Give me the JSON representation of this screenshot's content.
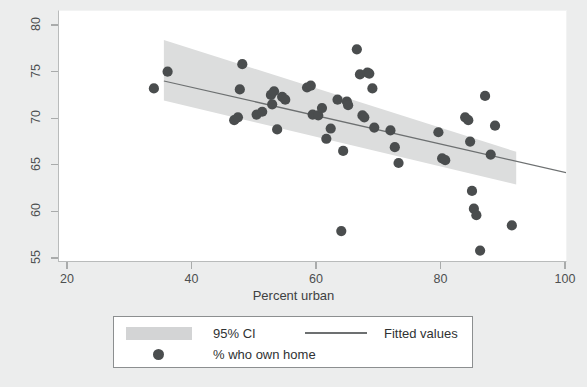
{
  "chart_data": {
    "type": "scatter",
    "title": "",
    "xlabel": "Percent urban",
    "ylabel": "",
    "xlim": [
      20,
      100
    ],
    "ylim": [
      53.5,
      81.5
    ],
    "xticks": [
      20,
      40,
      60,
      80,
      100
    ],
    "yticks": [
      55,
      60,
      65,
      70,
      75,
      80
    ],
    "grid": false,
    "legend_position": "below-axes",
    "series": [
      {
        "name": "% who own home",
        "type": "scatter",
        "marker": "circle",
        "color": "#4a4d4e",
        "points": [
          [
            33.8,
            73.3
          ],
          [
            36.0,
            75.1
          ],
          [
            46.7,
            69.9
          ],
          [
            47.3,
            70.2
          ],
          [
            47.6,
            73.2
          ],
          [
            48.0,
            75.9
          ],
          [
            50.3,
            70.5
          ],
          [
            51.2,
            70.8
          ],
          [
            52.6,
            72.6
          ],
          [
            52.8,
            71.6
          ],
          [
            53.1,
            73.0
          ],
          [
            53.6,
            68.9
          ],
          [
            54.4,
            72.4
          ],
          [
            54.9,
            72.1
          ],
          [
            58.4,
            73.4
          ],
          [
            59.0,
            73.6
          ],
          [
            59.3,
            70.5
          ],
          [
            60.2,
            70.4
          ],
          [
            60.8,
            71.2
          ],
          [
            61.5,
            67.9
          ],
          [
            62.2,
            69.0
          ],
          [
            63.3,
            72.1
          ],
          [
            63.9,
            58.0
          ],
          [
            64.2,
            66.6
          ],
          [
            64.8,
            71.9
          ],
          [
            65.0,
            71.5
          ],
          [
            66.4,
            77.5
          ],
          [
            66.9,
            74.8
          ],
          [
            67.3,
            70.4
          ],
          [
            67.6,
            70.2
          ],
          [
            68.1,
            75.0
          ],
          [
            68.4,
            74.9
          ],
          [
            68.9,
            73.3
          ],
          [
            69.2,
            69.1
          ],
          [
            71.8,
            68.8
          ],
          [
            72.5,
            67.0
          ],
          [
            73.1,
            65.3
          ],
          [
            79.5,
            68.6
          ],
          [
            80.1,
            65.8
          ],
          [
            80.6,
            65.6
          ],
          [
            83.8,
            70.2
          ],
          [
            84.3,
            69.9
          ],
          [
            84.6,
            67.6
          ],
          [
            84.9,
            62.3
          ],
          [
            85.2,
            60.4
          ],
          [
            85.6,
            59.7
          ],
          [
            86.2,
            55.9
          ],
          [
            87.0,
            72.5
          ],
          [
            87.9,
            66.2
          ],
          [
            88.6,
            69.3
          ],
          [
            91.3,
            58.6
          ]
        ]
      },
      {
        "name": "Fitted values",
        "type": "line",
        "color": "#6d7071",
        "endpoints": [
          [
            35.4,
            74.1
          ],
          [
            101.8,
            64.0
          ]
        ]
      },
      {
        "name": "95% CI",
        "type": "band",
        "color": "#dcdddd",
        "x_range": [
          35.4,
          92.0
        ],
        "upper": [
          [
            35.4,
            78.5
          ],
          [
            92.0,
            66.5
          ]
        ],
        "lower": [
          [
            35.4,
            72.0
          ],
          [
            92.0,
            63.0
          ]
        ]
      }
    ]
  },
  "axes": {
    "y_tick_labels": [
      "55",
      "60",
      "65",
      "70",
      "75",
      "80"
    ],
    "x_tick_labels": [
      "20",
      "40",
      "60",
      "80",
      "100"
    ],
    "x_title": "Percent urban"
  },
  "legend": {
    "items": [
      {
        "label": "95% CI",
        "swatch": "band-swatch"
      },
      {
        "label": "Fitted values",
        "swatch": "line-swatch"
      },
      {
        "label": "% who own home",
        "swatch": "dot-swatch"
      }
    ]
  },
  "colors": {
    "background": "#eceded",
    "plot_background": "#ffffff",
    "marker": "#4a4d4e",
    "fit_line": "#6d7071",
    "ci_band": "#dcdddd",
    "axis": "#a9abab",
    "text": "#3e4142"
  }
}
